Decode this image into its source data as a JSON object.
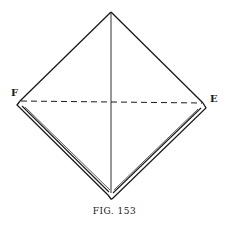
{
  "figure": {
    "caption": "FIG. 153",
    "labels": {
      "left_vertex": "F",
      "right_vertex": "E"
    },
    "colors": {
      "line": "#1a1a1a",
      "background": "#ffffff"
    },
    "elements": [
      {
        "type": "square-diamond",
        "description": "folded paper square shown as diamond"
      },
      {
        "type": "solid-line",
        "description": "vertical crease from top vertex to bottom vertex"
      },
      {
        "type": "dashed-line",
        "description": "horizontal fold line from F to E"
      },
      {
        "type": "layered-edges",
        "description": "double lines along lower-left and lower-right edges showing folded layers"
      }
    ]
  }
}
